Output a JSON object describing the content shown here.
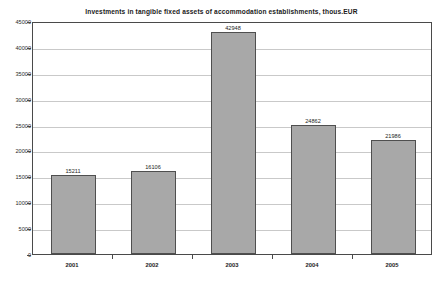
{
  "chart_data": {
    "type": "bar",
    "title": "Investments in tangible fixed assets of accommodation establishments, thous.EUR",
    "xlabel": "",
    "ylabel": "",
    "categories": [
      "2001",
      "2002",
      "2003",
      "2004",
      "2005"
    ],
    "values": [
      15211,
      16106,
      42948,
      24862,
      21986
    ],
    "value_labels": [
      "15211",
      "16106",
      "42948",
      "24862",
      "21986"
    ],
    "ylim": [
      0,
      45000
    ],
    "ytick_step": 5000,
    "yticks": [
      0,
      5000,
      10000,
      15000,
      20000,
      25000,
      30000,
      35000,
      40000,
      45000
    ],
    "ytick_labels": [
      "0",
      "5000",
      "10000",
      "15000",
      "20000",
      "25000",
      "30000",
      "35000",
      "40000",
      "45000"
    ],
    "grid": true,
    "grid_axis": "y",
    "legend": false,
    "legend_position": "none",
    "series": [
      {
        "name": "Investments",
        "values": [
          15211,
          16106,
          42948,
          24862,
          21986
        ]
      }
    ]
  },
  "style": {
    "bar_fill": "#a8a8a8",
    "bar_border": "#4f4f4f",
    "frame_color": "#4a4a4a",
    "grid_color": "#c9c9c9",
    "text_color": "#1c1c1c",
    "background": "#ffffff"
  }
}
